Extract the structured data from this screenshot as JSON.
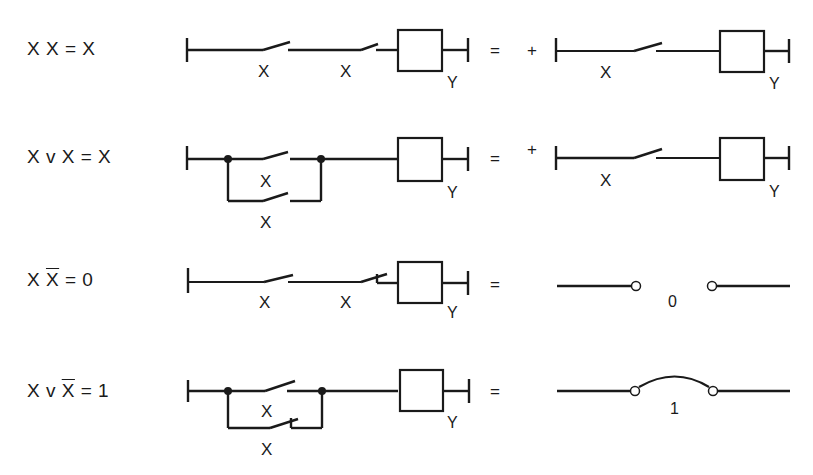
{
  "diagram": {
    "rows": [
      {
        "id": "idempotent-and",
        "equation": {
          "parts": [
            "X  X = X"
          ]
        },
        "left_circuit": {
          "type": "series",
          "contacts": [
            "X",
            "X"
          ],
          "coil": "Y"
        },
        "equals": "=",
        "plus": "+",
        "right_circuit": {
          "type": "single",
          "contacts": [
            "X"
          ],
          "coil": "Y"
        }
      },
      {
        "id": "idempotent-or",
        "equation": {
          "parts": [
            "X v X = X"
          ]
        },
        "left_circuit": {
          "type": "parallel",
          "contacts": [
            "X",
            "X"
          ],
          "coil": "Y"
        },
        "equals": "=",
        "plus": "+",
        "right_circuit": {
          "type": "single",
          "contacts": [
            "X"
          ],
          "coil": "Y"
        }
      },
      {
        "id": "complement-and",
        "equation": {
          "pre": "X  ",
          "bar": "X",
          "post": " = 0"
        },
        "left_circuit": {
          "type": "series",
          "contacts": [
            "X",
            "X"
          ],
          "contact_types": [
            "NO",
            "NC"
          ],
          "coil": "Y"
        },
        "equals": "=",
        "right_circuit": {
          "type": "open",
          "label": "0"
        }
      },
      {
        "id": "complement-or",
        "equation": {
          "pre": "X v ",
          "bar": "X",
          "post": " = 1"
        },
        "left_circuit": {
          "type": "parallel",
          "contacts": [
            "X",
            "X"
          ],
          "contact_types": [
            "NO",
            "NC"
          ],
          "coil": "Y"
        },
        "equals": "=",
        "right_circuit": {
          "type": "closed",
          "label": "1"
        }
      }
    ],
    "labels": {
      "contact": "X",
      "coil": "Y",
      "equals": "=",
      "plus": "+",
      "zero": "0",
      "one": "1"
    },
    "colors": {
      "ink": "#1a1a1a",
      "background": "#ffffff"
    }
  }
}
